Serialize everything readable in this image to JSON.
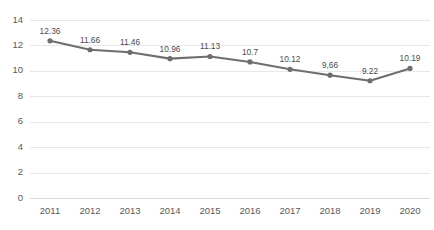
{
  "chart_data": {
    "type": "line",
    "title": "",
    "subtitle": "",
    "xlabel": "",
    "ylabel": "",
    "categories": [
      "2011",
      "2012",
      "2013",
      "2014",
      "2015",
      "2016",
      "2017",
      "2018",
      "2019",
      "2020"
    ],
    "values": [
      12.36,
      11.66,
      11.46,
      10.96,
      11.13,
      10.7,
      10.12,
      9.66,
      9.22,
      10.19
    ],
    "point_labels": [
      "12.36",
      "11.66",
      "11.46",
      "10.96",
      "11.13",
      "10.7",
      "10.12",
      "9,66",
      "9.22",
      "10.19"
    ],
    "series": [
      {
        "name": "",
        "values": [
          12.36,
          11.66,
          11.46,
          10.96,
          11.13,
          10.7,
          10.12,
          9.66,
          9.22,
          10.19
        ]
      }
    ],
    "ylim": [
      0,
      14
    ],
    "yticks": [
      0,
      2,
      4,
      6,
      8,
      10,
      12,
      14
    ],
    "ytick_labels": [
      "0",
      "2",
      "4",
      "6",
      "8",
      "10",
      "12",
      "14"
    ],
    "grid": "horizontal",
    "legend": "none",
    "line_color": "#6e6e6e",
    "marker_color": "#6e6e6e",
    "grid_color": "#e8e8e8",
    "background_color": "#ffffff",
    "data_labels_visible": true
  }
}
